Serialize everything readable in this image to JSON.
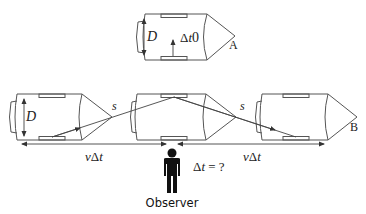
{
  "diagram": {
    "type": "light-clock time dilation illustration",
    "top_ship": {
      "label": "A",
      "width_label": "D",
      "time_label_prefix": "Δ",
      "time_label_var": "t",
      "time_label_sub": "0"
    },
    "moving_ships": [
      {
        "position": "left",
        "width_label": "D"
      },
      {
        "position": "middle"
      },
      {
        "position": "right",
        "label": "B"
      }
    ],
    "path_labels": [
      "s",
      "s"
    ],
    "distance_labels": [
      {
        "prefix": "v",
        "delta": "Δ",
        "var": "t"
      },
      {
        "prefix": "v",
        "delta": "Δ",
        "var": "t"
      }
    ],
    "observer": {
      "label": "Observer",
      "question_prefix": "Δ",
      "question_var": "t",
      "question_suffix": " = ?"
    },
    "colors": {
      "line": "#555555",
      "text": "#222222",
      "figure": "#111111",
      "background": "#ffffff"
    }
  }
}
